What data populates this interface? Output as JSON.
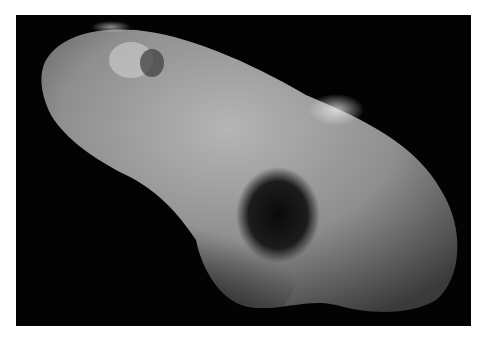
{
  "image": {
    "subject": "asteroid",
    "description": "Grayscale photograph of an elongated, cratered asteroid against a black space background",
    "colors": {
      "background": "#030303",
      "surface_light": "#b8b8b8",
      "surface_mid": "#8a8a8a",
      "shadow": "#1a1a1a",
      "border": "#ffffff"
    }
  }
}
